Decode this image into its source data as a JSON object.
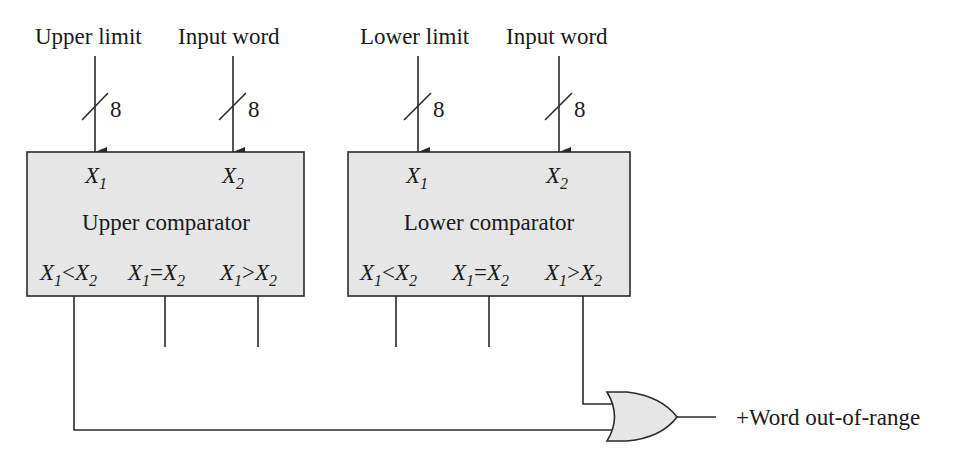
{
  "diagram": {
    "inputs": {
      "upper_limit": "Upper limit",
      "input_word_1": "Input word",
      "lower_limit": "Lower limit",
      "input_word_2": "Input word",
      "bus_width": "8"
    },
    "upper_comparator": {
      "title": "Upper comparator",
      "x1": "X",
      "x1_sub": "1",
      "x2": "X",
      "x2_sub": "2",
      "outputs": [
        {
          "op": "<"
        },
        {
          "op": "="
        },
        {
          "op": ">"
        }
      ]
    },
    "lower_comparator": {
      "title": "Lower comparator",
      "x1": "X",
      "x1_sub": "1",
      "x2": "X",
      "x2_sub": "2",
      "outputs": [
        {
          "op": "<"
        },
        {
          "op": "="
        },
        {
          "op": ">"
        }
      ]
    },
    "gate": {
      "type": "OR"
    },
    "output_label": "+Word out-of-range",
    "colors": {
      "box_fill": "#e6e6e6",
      "line": "#2a2a2a",
      "background": "#ffffff"
    }
  }
}
